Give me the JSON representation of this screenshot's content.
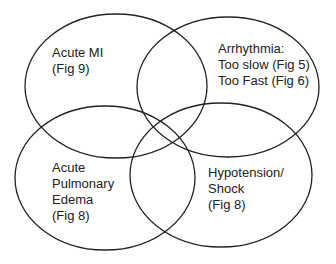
{
  "diagram": {
    "type": "venn",
    "stroke_color": "#222222",
    "background": "#ffffff",
    "sets": [
      {
        "id": "acute-mi",
        "lines": [
          "Acute MI",
          "(Fig 9)"
        ],
        "ellipse": {
          "cx": 116,
          "cy": 86,
          "rx": 91,
          "ry": 72
        }
      },
      {
        "id": "arrhythmia",
        "lines": [
          "Arrhythmia:",
          "Too slow (Fig 5)",
          "Too Fast (Fig 6)"
        ],
        "ellipse": {
          "cx": 228,
          "cy": 87,
          "rx": 91,
          "ry": 70
        }
      },
      {
        "id": "acute-pulmonary-edema",
        "lines": [
          "Acute",
          "Pulmonary",
          "Edema",
          "(Fig 8)"
        ],
        "ellipse": {
          "cx": 105,
          "cy": 178,
          "rx": 90,
          "ry": 72
        }
      },
      {
        "id": "hypotension-shock",
        "lines": [
          "Hypotension/",
          "Shock",
          "(Fig 8)"
        ],
        "ellipse": {
          "cx": 221,
          "cy": 175,
          "rx": 91,
          "ry": 72
        }
      }
    ]
  }
}
